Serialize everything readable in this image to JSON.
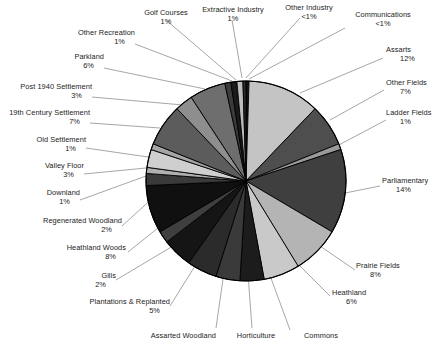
{
  "chart_data": {
    "type": "pie",
    "title": "",
    "legend_position": "callout-labels",
    "start_angle_deg": 0,
    "direction": "clockwise",
    "center": {
      "x": 246,
      "y": 181
    },
    "radius": 100,
    "categories": [
      "Communications",
      "Assarts",
      "Other Fields",
      "Ladder Fields",
      "Parliamentary",
      "Prairie Fields",
      "Heathland",
      "Commons",
      "Horticulture",
      "Assarted Woodland",
      "Plantations & Replanted",
      "Gills",
      "Heathland Woods",
      "Regenerated Woodland",
      "Downland",
      "Valley Floor",
      "Old Settlement",
      "19th Century Settlement",
      "Post 1940 Settlement",
      "Parkland",
      "Other Recreation",
      "Golf Courses",
      "Extractive Industry",
      "Other Industry"
    ],
    "values": [
      0.5,
      12,
      7,
      1,
      14,
      8,
      6,
      4,
      4,
      5,
      5,
      2,
      8,
      2,
      1,
      3,
      1,
      7,
      3,
      6,
      1,
      1,
      1,
      0.5
    ],
    "labels": [
      "<1%",
      "12%",
      "7%",
      "1%",
      "14%",
      "8%",
      "6%",
      "4%",
      "4%",
      "5%",
      "5%",
      "2%",
      "8%",
      "2%",
      "1%",
      "3%",
      "1%",
      "7%",
      "3%",
      "6%",
      "1%",
      "1%",
      "1%",
      "<1%"
    ],
    "slice_colors": [
      "#111111",
      "#c4c4c4",
      "#4e4e4e",
      "#9a9a9a",
      "#3f3f3f",
      "#b4b4b4",
      "#c9c9c9",
      "#1c1c1c",
      "#3a3a3a",
      "#2b2b2b",
      "#151515",
      "#3f3f3f",
      "#101010",
      "#3a3a3a",
      "#b0b0b0",
      "#cfcfcf",
      "#a5a5a5",
      "#5c5c5c",
      "#8e8e8e",
      "#6e6e6e",
      "#3c3c3c",
      "#1a1a1a",
      "#bdbdbd",
      "#2a2a2a"
    ],
    "slice_outline": "#000000",
    "background": "#ffffff"
  },
  "labels": {
    "golf_courses": {
      "name": "Golf Courses",
      "pct": "1%"
    },
    "extractive_industry": {
      "name": "Extractive Industry",
      "pct": "1%"
    },
    "other_industry": {
      "name": "Other Industry",
      "pct": "<1%"
    },
    "communications": {
      "name": "Communications",
      "pct": "<1%"
    },
    "other_recreation": {
      "name": "Other Recreation",
      "pct": "1%"
    },
    "assarts": {
      "name": "Assarts",
      "pct": "12%"
    },
    "parkland": {
      "name": "Parkland",
      "pct": "6%"
    },
    "other_fields": {
      "name": "Other Fields",
      "pct": "7%"
    },
    "post_1940_settlement": {
      "name": "Post 1940 Settlement",
      "pct": "3%"
    },
    "ladder_fields": {
      "name": "Ladder Fields",
      "pct": "1%"
    },
    "c19_settlement": {
      "name": "19th Century Settlement",
      "pct": "7%"
    },
    "old_settlement": {
      "name": "Old Settlement",
      "pct": "1%"
    },
    "valley_floor": {
      "name": "Valley Floor",
      "pct": "3%"
    },
    "parliamentary": {
      "name": "Parliamentary",
      "pct": "14%"
    },
    "downland": {
      "name": "Downland",
      "pct": "1%"
    },
    "regenerated_woodland": {
      "name": "Regenerated Woodland",
      "pct": "2%"
    },
    "heathland_woods": {
      "name": "Heathland Woods",
      "pct": "8%"
    },
    "prairie_fields": {
      "name": "Prairie Fields",
      "pct": "8%"
    },
    "gills": {
      "name": "Gills",
      "pct": "2%"
    },
    "heathland": {
      "name": "Heathland",
      "pct": "6%"
    },
    "plantations_replanted": {
      "name": "Plantations & Replanted",
      "pct": "5%"
    },
    "assarted_woodland": {
      "name": "Assarted Woodland",
      "pct": ""
    },
    "horticulture": {
      "name": "Horticulture",
      "pct": ""
    },
    "commons": {
      "name": "Commons",
      "pct": ""
    }
  }
}
